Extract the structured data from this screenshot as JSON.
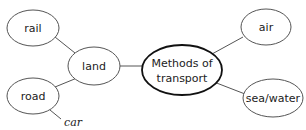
{
  "diagram": {
    "type": "mind-map",
    "central": {
      "label_line1": "Methods of",
      "label_line2": "transport"
    },
    "nodes": {
      "air": "air",
      "sea": "sea/water",
      "land": "land",
      "rail": "rail",
      "road": "road"
    },
    "leaves": {
      "car": "car"
    },
    "colors": {
      "stroke": "#555555",
      "central_stroke": "#111111",
      "text": "#222222",
      "background": "#ffffff"
    }
  }
}
